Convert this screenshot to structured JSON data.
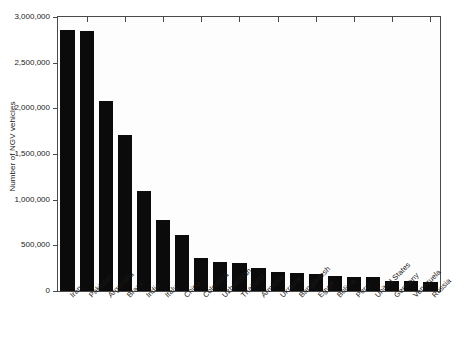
{
  "chart_data": {
    "type": "bar",
    "title": "",
    "xlabel": "",
    "ylabel": "Number of NGV vehicles",
    "ylim": [
      0,
      3000000
    ],
    "ytick_labels": [
      "0",
      "500,000",
      "1,000,000",
      "1,500,000",
      "2,000,000",
      "2,500,000",
      "3,000,000"
    ],
    "ytick_values": [
      0,
      500000,
      1000000,
      1500000,
      2000000,
      2500000,
      3000000
    ],
    "grid": false,
    "legend": "none",
    "bar_color": "#0b0b0b",
    "categories": [
      "Iran",
      "Pakistan",
      "Argentina",
      "Brazil",
      "India",
      "Italy",
      "China",
      "Colombia",
      "Uzbekistan",
      "Thailand",
      "Armenia",
      "Ukraine",
      "Bangladesh",
      "Egypt",
      "Bolivia",
      "Peru",
      "United States",
      "Germany",
      "Venezuela",
      "Russia"
    ],
    "values": [
      2860000,
      2850000,
      2080000,
      1710000,
      1100000,
      780000,
      610000,
      360000,
      320000,
      310000,
      250000,
      210000,
      200000,
      190000,
      160000,
      155000,
      150000,
      110000,
      105000,
      100000
    ]
  }
}
